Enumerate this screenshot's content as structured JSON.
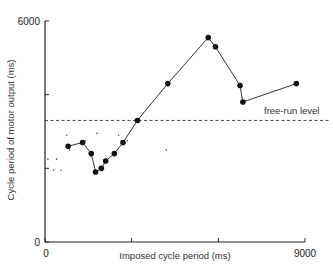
{
  "chart_data": {
    "type": "line",
    "title": "",
    "xlabel": "Imposed cycle period (ms)",
    "ylabel": "Cycle period of motor output (ms)",
    "xlim": [
      0,
      9000
    ],
    "ylim": [
      0,
      6000
    ],
    "x_tick_labels": [
      "0",
      "9000"
    ],
    "x_ticks": [
      0,
      3000,
      6000,
      9000
    ],
    "y_tick_labels": [
      "0",
      "6000"
    ],
    "y_ticks": [
      0,
      2000,
      4000,
      6000
    ],
    "grid": false,
    "legend": null,
    "series": [
      {
        "name": "motor output",
        "style": "line-with-filled-circles",
        "x": [
          800,
          1300,
          1600,
          1750,
          1950,
          2100,
          2400,
          2700,
          3200,
          4250,
          5650,
          5900,
          6750,
          6850,
          8700
        ],
        "y": [
          2600,
          2700,
          2400,
          1900,
          2000,
          2200,
          2400,
          2700,
          3300,
          4300,
          5550,
          5300,
          4250,
          3800,
          4300
        ]
      },
      {
        "name": "scattered small dots",
        "style": "small-dots",
        "x": [
          100,
          300,
          400,
          550,
          750,
          850,
          1400,
          1800,
          2550,
          2850,
          4200
        ],
        "y": [
          2250,
          1950,
          2250,
          1950,
          2900,
          2500,
          2750,
          2950,
          2900,
          2750,
          2500
        ]
      }
    ],
    "reference_lines": [
      {
        "type": "horizontal",
        "y": 3300,
        "style": "dashed",
        "label": "free-run level"
      }
    ],
    "annotations": [
      {
        "text": "free-run level",
        "x": 7700,
        "y": 3500
      }
    ]
  },
  "labels": {
    "x_axis": "Imposed cycle period (ms)",
    "y_axis": "Cycle period of motor output (ms)",
    "x_min": "0",
    "x_max": "9000",
    "y_min": "0",
    "y_max": "6000",
    "free_run": "free-run level"
  }
}
